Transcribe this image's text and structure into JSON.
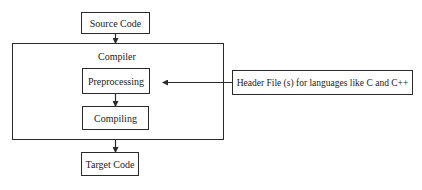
{
  "diagram": {
    "type": "flowchart",
    "nodes": {
      "source_code": "Source Code",
      "compiler_group": "Compiler",
      "preprocessing": "Preprocessing",
      "compiling": "Compiling",
      "target_code": "Target Code",
      "header_files": "Header File (s) for languages like C and C++"
    },
    "edges": [
      {
        "from": "Source Code",
        "to": "Compiler"
      },
      {
        "from": "Preprocessing",
        "to": "Compiling"
      },
      {
        "from": "Compiler",
        "to": "Target Code"
      },
      {
        "from": "Header File (s) for languages like C and C++",
        "to": "Preprocessing"
      }
    ],
    "colors": {
      "stroke": "#2a2a2a",
      "background": "#ffffff",
      "text": "#1a1a1a"
    }
  }
}
